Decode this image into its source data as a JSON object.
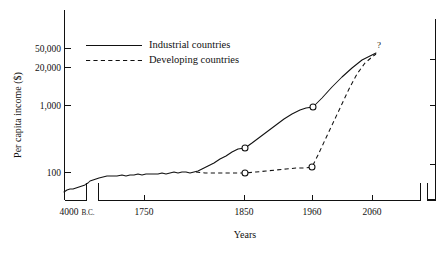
{
  "chart_data": {
    "type": "line",
    "title": "",
    "subtitle": "",
    "xlabel": "Years",
    "ylabel": "Per capita income ($)",
    "y_scale": "log",
    "y_ticks": [
      {
        "value": 100,
        "label": "100",
        "py": 172
      },
      {
        "value": 1000,
        "label": "1,000",
        "py": 105
      },
      {
        "value": 20000,
        "label": "20,000",
        "py": 67
      },
      {
        "value": 50000,
        "label": "50,000",
        "py": 48
      }
    ],
    "x_ticks": [
      {
        "label_main": "4000",
        "label_suffix": "B.C.",
        "px": 75
      },
      {
        "label_main": "1750",
        "label_suffix": "",
        "px": 144
      },
      {
        "label_main": "1850",
        "label_suffix": "",
        "px": 244
      },
      {
        "label_main": "1960",
        "label_suffix": "",
        "px": 312
      },
      {
        "label_main": "2060",
        "label_suffix": "",
        "px": 372
      }
    ],
    "axis_break": {
      "left_segment_end_px": 86,
      "right_segment_start_px": 98
    },
    "grid": false,
    "legend_position": "upper-left-inside",
    "series": [
      {
        "name": "Industrial countries",
        "style": "solid",
        "points_px": "64,192 67,190 70,189 73,189 76,188 79,187 82,186 85,185 86,184 88,183 90,181 93,180 96,179 99,178 103,177 107,176 112,176 117,176 122,175 126,176 130,175 134,175 138,174 142,175 146,174 150,174 154,174 158,174 162,173 166,174 170,173 174,172 178,173 182,172 186,172 190,173 194,172 198,171 202,169 208,166 214,163 220,159 226,156 232,152 238,149 245,148 252,143 260,137 268,131 276,125 284,119 292,114 300,110 306,108 313,107 322,98 332,87 342,77 352,68 362,60 372,55 376,53",
        "markers_px": [
          [
            245,
            148
          ],
          [
            313,
            107
          ]
        ]
      },
      {
        "name": "Developing countries",
        "style": "dashed",
        "points_px": "196,172 205,173 215,173 225,173 235,173 245,173 256,172 266,171 276,170 286,169 296,168 305,168 312,167 318,155 325,140 333,123 341,106 349,89 357,74 365,63 372,57 376,54",
        "markers_px": [
          [
            245,
            173
          ],
          [
            312,
            167
          ]
        ]
      }
    ],
    "annotations": [
      {
        "text": "?",
        "px": 379,
        "py": 46
      }
    ]
  },
  "chart": {
    "y_axis_title": "Per capita income ($)",
    "x_axis_title": "Years",
    "legend": [
      {
        "label": "Industrial countries",
        "style": "solid"
      },
      {
        "label": "Developing countries",
        "style": "dashed"
      }
    ],
    "y_tick_labels": [
      "50,000",
      "20,000",
      "1,000",
      "100"
    ],
    "x_tick_labels": [
      "4000",
      "1750",
      "1850",
      "1960",
      "2060"
    ],
    "bc_suffix": "B.C.",
    "question_mark": "?"
  }
}
